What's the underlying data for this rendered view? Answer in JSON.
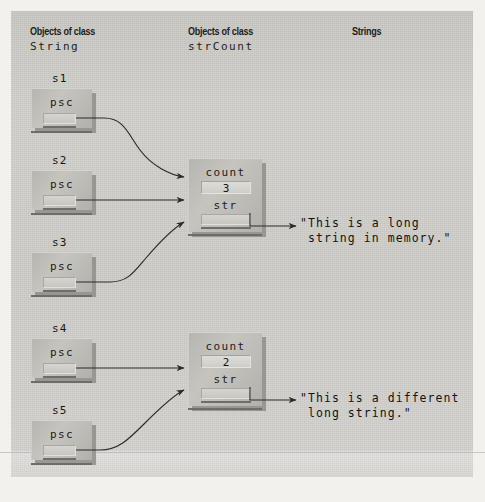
{
  "figure": {
    "title_columns": [
      {
        "kicker": "Objects of class",
        "class_name": "String"
      },
      {
        "kicker": "Objects of class",
        "class_name": "strCount"
      },
      {
        "kicker": "Strings",
        "class_name": ""
      }
    ],
    "colors": {
      "page_background": "#f2f1ee",
      "panel_background": "#cfcdc8",
      "object_fill": "#bcbab5",
      "slot_fill": "#d2d0cb",
      "ink": "#161616",
      "shadow": "#8f8d88"
    }
  },
  "string_objects": [
    {
      "var": "s1",
      "field_label": "psc"
    },
    {
      "var": "s2",
      "field_label": "psc"
    },
    {
      "var": "s3",
      "field_label": "psc"
    },
    {
      "var": "s4",
      "field_label": "psc"
    },
    {
      "var": "s5",
      "field_label": "psc"
    }
  ],
  "strcount_objects": [
    {
      "count_label": "count",
      "count_value": "3",
      "str_label": "str"
    },
    {
      "count_label": "count",
      "count_value": "2",
      "str_label": "str"
    }
  ],
  "strings": [
    {
      "line1": "\"This is a long",
      "line2": " string in memory.\""
    },
    {
      "line1": "\"This is a different",
      "line2": " long string.\""
    }
  ]
}
